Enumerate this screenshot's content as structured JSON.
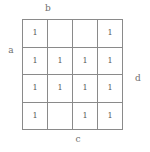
{
  "figure": {
    "type": "karnaugh-map",
    "edge_labels": {
      "top": "b",
      "left": "a",
      "right": "d",
      "bottom": "c"
    }
  },
  "chart_data": {
    "type": "table",
    "title": "",
    "xlabel": "",
    "ylabel": "",
    "rows": 4,
    "columns": 4,
    "grid": true,
    "legend": "none",
    "annotations": [
      "b",
      "a",
      "d",
      "c"
    ],
    "cells": [
      [
        "1",
        "",
        "",
        "1"
      ],
      [
        "1",
        "1",
        "1",
        "1"
      ],
      [
        "1",
        "1",
        "1",
        "1"
      ],
      [
        "1",
        "",
        "1",
        "1"
      ]
    ],
    "values": [
      [
        1,
        0,
        0,
        1
      ],
      [
        1,
        1,
        1,
        1
      ],
      [
        1,
        1,
        1,
        1
      ],
      [
        1,
        0,
        1,
        1
      ]
    ],
    "colors": {
      "grid_line": "#8a8a8a",
      "cell_text": "#5a5a5a",
      "label_text": "#6e6e6e",
      "background": "#ffffff"
    }
  }
}
